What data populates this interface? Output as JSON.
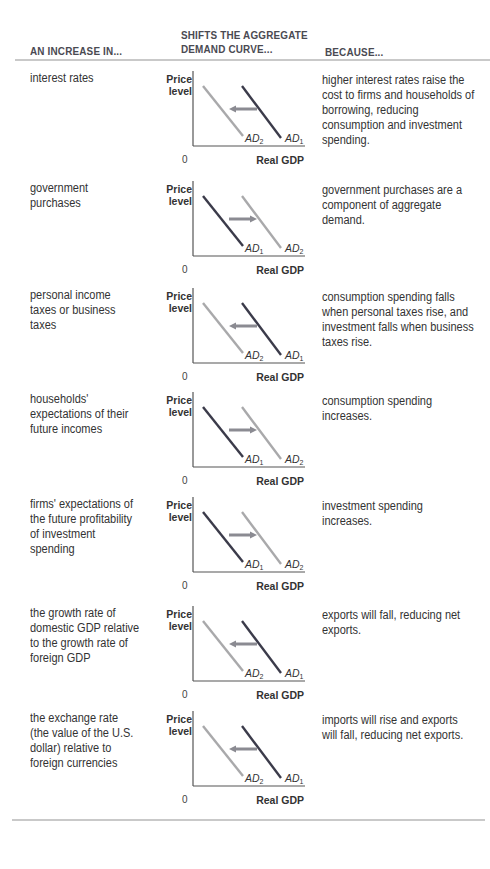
{
  "header": {
    "col1": "AN INCREASE IN...",
    "col2_line1": "SHIFTS THE AGGREGATE",
    "col2_line2": "DEMAND CURVE...",
    "col3": "BECAUSE..."
  },
  "graph_labels": {
    "y_axis": [
      "Price",
      "level"
    ],
    "x_axis": "Real GDP",
    "origin": "0",
    "curve_prefix": "AD",
    "curve1_sub": "1",
    "curve2_sub": "2"
  },
  "colors": {
    "initial_curve": "#3b3b4a",
    "shifted_curve": "#a9a9ab",
    "arrow": "#8b8b92",
    "rule": "#c9c9c9"
  },
  "rows": [
    {
      "cause": "interest rates",
      "shift": "left",
      "reason": "higher interest rates raise the cost to firms and households of borrowing, reducing consumption and investment spending."
    },
    {
      "cause": "government purchases",
      "shift": "right",
      "reason": "government purchases are a component of aggregate demand."
    },
    {
      "cause": "personal income taxes or business taxes",
      "shift": "left",
      "reason": "consumption spending falls when personal taxes rise, and investment falls when business taxes rise."
    },
    {
      "cause": "households' expectations of their future incomes",
      "shift": "right",
      "reason": "consumption spending increases."
    },
    {
      "cause": "firms' expectations of the future profitability of investment spending",
      "shift": "right",
      "reason": "investment spending increases."
    },
    {
      "cause": "the growth rate of domestic GDP relative to the growth rate of foreign GDP",
      "shift": "left",
      "reason": "exports will fall, reducing net exports."
    },
    {
      "cause": "the exchange rate (the value of the U.S. dollar) relative to foreign currencies",
      "shift": "left",
      "reason": "imports will rise and exports will fall, reducing net exports."
    }
  ]
}
